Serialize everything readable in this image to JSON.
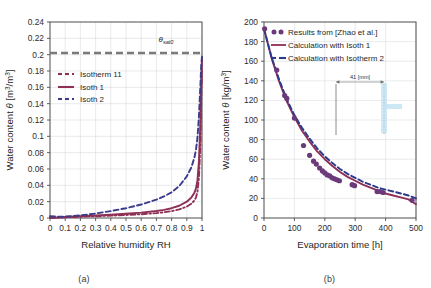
{
  "figure": {
    "panels": [
      {
        "tag": "(a)",
        "xlabel": "Relative humidity RH",
        "ylabel": "Water content θ [m³/m³]",
        "annotation": "θ",
        "annotation_sub": "sat0"
      },
      {
        "tag": "(b)",
        "xlabel": "Evaporation time [h]",
        "ylabel": "Water content θ [kg/m³]",
        "inset_label": "41 [mm]"
      }
    ]
  },
  "chart_data": [
    {
      "type": "line",
      "title": "",
      "xlabel": "Relative humidity RH",
      "ylabel": "Water content θ [m³/m³]",
      "xlim": [
        0,
        1
      ],
      "ylim": [
        0,
        0.24
      ],
      "xticks": [
        "0",
        "0.1",
        "0.2",
        "0.3",
        "0.4",
        "0.5",
        "0.6",
        "0.7",
        "0.8",
        "0.9",
        "1"
      ],
      "xtick_values": [
        0,
        0.1,
        0.2,
        0.3,
        0.4,
        0.5,
        0.6,
        0.7,
        0.8,
        0.9,
        1
      ],
      "yticks": [
        "0",
        "0.02",
        "0.04",
        "0.06",
        "0.08",
        "0.1",
        "0.12",
        "0.14",
        "0.16",
        "0.18",
        "0.2",
        "0.22",
        "0.24"
      ],
      "ytick_values": [
        0,
        0.02,
        0.04,
        0.06,
        0.08,
        0.1,
        0.12,
        0.14,
        0.16,
        0.18,
        0.2,
        0.22,
        0.24
      ],
      "grid": true,
      "legend_position": "upper-left",
      "annotations": [
        {
          "text": "θ_sat0",
          "value": 0.202,
          "style": "gray-dashed-horizontal-line"
        }
      ],
      "series": [
        {
          "name": "Isotherm 11",
          "color": "#8e2f55",
          "style": "dash-dot",
          "x": [
            0,
            0.1,
            0.2,
            0.3,
            0.4,
            0.5,
            0.6,
            0.7,
            0.75,
            0.8,
            0.85,
            0.9,
            0.93,
            0.95,
            0.96,
            0.97,
            0.98,
            0.99,
            0.995,
            1
          ],
          "y": [
            0,
            0.0009,
            0.0016,
            0.0022,
            0.0029,
            0.0037,
            0.0046,
            0.006,
            0.007,
            0.0084,
            0.0105,
            0.014,
            0.0175,
            0.0215,
            0.025,
            0.032,
            0.05,
            0.095,
            0.145,
            0.18
          ]
        },
        {
          "name": "Isoth 1",
          "color": "#8e2f55",
          "style": "solid",
          "x": [
            0,
            0.1,
            0.2,
            0.3,
            0.4,
            0.5,
            0.6,
            0.7,
            0.75,
            0.8,
            0.85,
            0.9,
            0.93,
            0.95,
            0.96,
            0.97,
            0.98,
            0.99,
            0.995,
            1
          ],
          "y": [
            0,
            0.0012,
            0.0021,
            0.003,
            0.004,
            0.0052,
            0.0066,
            0.0086,
            0.01,
            0.012,
            0.015,
            0.02,
            0.025,
            0.031,
            0.036,
            0.046,
            0.07,
            0.12,
            0.165,
            0.195
          ]
        },
        {
          "name": "Isoth 2",
          "color": "#3b3b8c",
          "style": "dashed",
          "x": [
            0,
            0.05,
            0.1,
            0.2,
            0.3,
            0.4,
            0.5,
            0.6,
            0.7,
            0.75,
            0.8,
            0.85,
            0.9,
            0.93,
            0.95,
            0.96,
            0.97,
            0.98,
            0.99,
            0.995,
            1
          ],
          "y": [
            0.0022,
            0.0016,
            0.0018,
            0.0032,
            0.0055,
            0.0085,
            0.012,
            0.0165,
            0.0225,
            0.0265,
            0.0315,
            0.039,
            0.051,
            0.062,
            0.074,
            0.083,
            0.098,
            0.125,
            0.165,
            0.187,
            0.198
          ]
        }
      ]
    },
    {
      "type": "line",
      "title": "",
      "xlabel": "Evaporation time [h]",
      "ylabel": "Water content θ [kg/m³]",
      "xlim": [
        0,
        500
      ],
      "ylim": [
        0,
        200
      ],
      "xticks": [
        "0",
        "100",
        "200",
        "300",
        "400",
        "500"
      ],
      "xtick_values": [
        0,
        100,
        200,
        300,
        400,
        500
      ],
      "yticks": [
        "0",
        "20",
        "40",
        "60",
        "80",
        "100",
        "120",
        "140",
        "160",
        "180",
        "200"
      ],
      "ytick_values": [
        0,
        20,
        40,
        60,
        80,
        100,
        120,
        140,
        160,
        180,
        200
      ],
      "grid": true,
      "legend_position": "upper-right",
      "inset": {
        "label": "41 [mm]",
        "color": "#a8d8ef"
      },
      "series": [
        {
          "name": "Results from [Zhao et al.]",
          "color": "#6b3a7a",
          "style": "markers",
          "x": [
            2,
            42,
            68,
            75,
            100,
            130,
            150,
            163,
            172,
            183,
            192,
            200,
            208,
            216,
            224,
            232,
            240,
            248,
            290,
            298,
            372,
            382,
            392,
            487
          ],
          "y": [
            193,
            151,
            125,
            122,
            102,
            74,
            64,
            58,
            55,
            51,
            48,
            46,
            44,
            43,
            41,
            40,
            39,
            38,
            34,
            33,
            27,
            27,
            26,
            18
          ]
        },
        {
          "name": "Calculation with Isoth 1",
          "color": "#8e2f55",
          "style": "solid",
          "x": [
            0,
            25,
            50,
            75,
            100,
            125,
            150,
            175,
            200,
            225,
            250,
            275,
            300,
            325,
            350,
            375,
            400,
            425,
            450,
            475,
            500
          ],
          "y": [
            193,
            163,
            139,
            119,
            103,
            89,
            78,
            68,
            60,
            53,
            47,
            42,
            38,
            34,
            31,
            28,
            25,
            23,
            21,
            19,
            14
          ]
        },
        {
          "name": "Calculation with Isotherm 2",
          "color": "#2b3a8c",
          "style": "dashed",
          "x": [
            0,
            25,
            50,
            75,
            100,
            125,
            150,
            175,
            200,
            225,
            250,
            275,
            300,
            325,
            350,
            375,
            400,
            425,
            450,
            475,
            500
          ],
          "y": [
            193,
            164,
            141,
            121,
            105,
            92,
            81,
            71,
            63,
            56,
            50,
            45,
            41,
            37,
            34,
            31,
            29,
            27,
            25,
            23,
            20
          ]
        }
      ]
    }
  ]
}
